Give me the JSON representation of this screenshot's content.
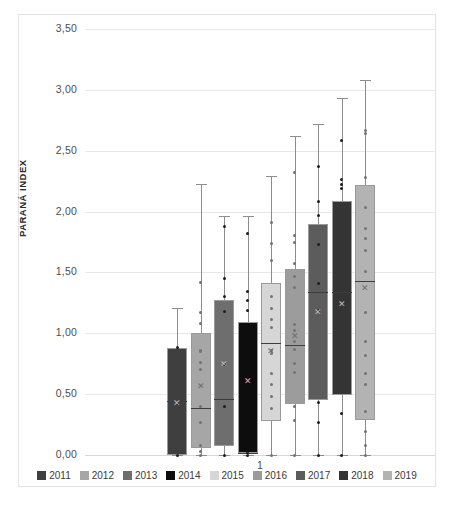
{
  "chart_data": {
    "type": "box",
    "title": "",
    "xlabel": "1",
    "ylabel": "PARANÁ INDEX",
    "ylim": [
      0.0,
      3.5
    ],
    "ytick_labels": [
      "0,00",
      "0,50",
      "1,00",
      "1,50",
      "2,00",
      "2,50",
      "3,00",
      "3,50"
    ],
    "ytick_values": [
      0.0,
      0.5,
      1.0,
      1.5,
      2.0,
      2.5,
      3.0,
      3.5
    ],
    "grid": true,
    "legend_position": "bottom",
    "categories": [
      "1"
    ],
    "series": [
      {
        "name": "2011",
        "color": "#3f3f3f",
        "min": 0.0,
        "q1": 0.0,
        "median": 0.44,
        "mean": 0.42,
        "q3": 0.88,
        "max": 1.21,
        "points": [
          0.0,
          0.42,
          0.88
        ]
      },
      {
        "name": "2012",
        "color": "#a6a6a6",
        "min": 0.0,
        "q1": 0.06,
        "median": 0.39,
        "mean": 0.56,
        "q3": 1.0,
        "max": 2.23,
        "points": [
          0.0,
          0.03,
          0.08,
          0.27,
          0.4,
          0.7,
          0.76,
          0.85,
          0.86,
          1.08,
          1.17,
          1.42
        ]
      },
      {
        "name": "2013",
        "color": "#6e6e6e",
        "min": 0.0,
        "q1": 0.07,
        "median": 0.46,
        "mean": 0.74,
        "q3": 1.27,
        "max": 1.96,
        "points": [
          0.0,
          0.4,
          0.74,
          1.18,
          1.3,
          1.45,
          1.88
        ]
      },
      {
        "name": "2014",
        "color": "#0d0d0d",
        "min": 0.0,
        "q1": 0.02,
        "median": 0.02,
        "mean": 0.6,
        "q3": 1.09,
        "max": 1.96,
        "points": [
          0.0,
          0.02,
          1.19,
          1.27,
          1.34,
          1.82
        ]
      },
      {
        "name": "2015",
        "color": "#d6d6d6",
        "min": 0.0,
        "q1": 0.28,
        "median": 0.92,
        "mean": 0.85,
        "q3": 1.41,
        "max": 2.29,
        "points": [
          0.0,
          0.38,
          0.48,
          0.58,
          0.67,
          0.83,
          0.86,
          1.05,
          1.11,
          1.2,
          1.3,
          1.6,
          1.74,
          1.91
        ]
      },
      {
        "name": "2016",
        "color": "#9c9c9c",
        "min": 0.0,
        "q1": 0.42,
        "median": 0.9,
        "mean": 0.97,
        "q3": 1.53,
        "max": 2.62,
        "points": [
          0.0,
          0.28,
          0.4,
          0.68,
          0.75,
          0.87,
          0.93,
          1.02,
          1.07,
          1.38,
          1.47,
          1.57,
          1.75,
          1.8,
          2.32
        ]
      },
      {
        "name": "2017",
        "color": "#5c5c5c",
        "min": 0.0,
        "q1": 0.45,
        "median": 1.34,
        "mean": 1.17,
        "q3": 1.9,
        "max": 2.72,
        "points": [
          0.0,
          0.27,
          0.43,
          1.19,
          1.41,
          1.73,
          1.97,
          2.08,
          2.37
        ]
      },
      {
        "name": "2018",
        "color": "#343434",
        "min": 0.0,
        "q1": 0.49,
        "median": 1.34,
        "mean": 1.23,
        "q3": 2.09,
        "max": 2.93,
        "points": [
          0.0,
          0.34,
          2.19,
          2.22,
          2.26,
          2.58
        ]
      },
      {
        "name": "2019",
        "color": "#b3b3b3",
        "min": 0.0,
        "q1": 0.29,
        "median": 1.43,
        "mean": 1.36,
        "q3": 2.22,
        "max": 3.08,
        "points": [
          0.0,
          0.08,
          0.19,
          0.36,
          0.58,
          0.67,
          0.82,
          0.93,
          1.17,
          1.51,
          1.68,
          1.78,
          1.86,
          2.03,
          2.28,
          2.64,
          2.67
        ]
      }
    ]
  },
  "legend": {
    "items": [
      {
        "label": "2011",
        "color": "#3f3f3f"
      },
      {
        "label": "2012",
        "color": "#a6a6a6"
      },
      {
        "label": "2013",
        "color": "#6e6e6e"
      },
      {
        "label": "2014",
        "color": "#0d0d0d"
      },
      {
        "label": "2015",
        "color": "#d6d6d6"
      },
      {
        "label": "2016",
        "color": "#9c9c9c"
      },
      {
        "label": "2017",
        "color": "#5c5c5c"
      },
      {
        "label": "2018",
        "color": "#343434"
      },
      {
        "label": "2019",
        "color": "#b3b3b3"
      }
    ]
  }
}
